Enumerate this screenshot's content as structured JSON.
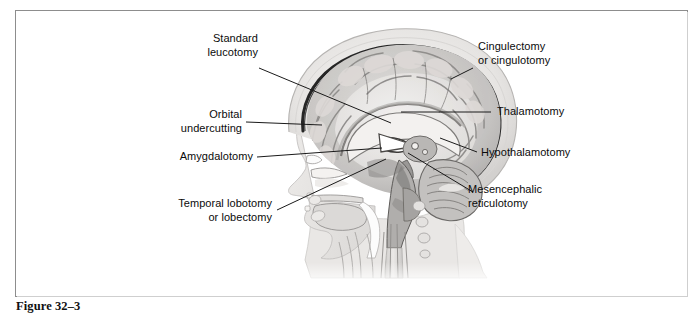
{
  "figure": {
    "caption": "Figure 32–3",
    "frame_color": "#8d8d8d",
    "background": "#ffffff",
    "text_color": "#0b0b0b",
    "leader_line_color": "#1a1a1a"
  },
  "illustration": {
    "name": "mid-sagittal-head-section",
    "description": "Grayscale halftone mid-sagittal anatomical section of a human head and neck showing cerebrum, corpus callosum, thalamus, cerebellum, brainstem, nasal cavity, tongue, pharynx and cervical vertebrae",
    "tones": {
      "skin": "#e8e6e4",
      "skull": "#f2f0ee",
      "dura": "#2a2a2a",
      "cortex": "#c9c7c5",
      "white_matter": "#efedeb",
      "deep_gray": "#a6a4a2",
      "cerebellum": "#bcbab8",
      "airway": "#fbfbfb",
      "cord": "#d8d6d4"
    }
  },
  "labels": [
    {
      "id": "standard-leucotomy",
      "text": "Standard\nleucotomy",
      "align": "right",
      "x": 196,
      "y": 32,
      "w": 62,
      "leader": {
        "x1": 259,
        "y1": 68,
        "x2": 391,
        "y2": 123
      }
    },
    {
      "id": "orbital-undercutting",
      "text": "Orbital\nundercutting",
      "align": "right",
      "x": 166,
      "y": 108,
      "w": 76,
      "leader": {
        "x1": 246,
        "y1": 122,
        "x2": 322,
        "y2": 125
      }
    },
    {
      "id": "amygdalotomy",
      "text": "Amygdalotomy",
      "align": "right",
      "x": 167,
      "y": 150,
      "w": 86,
      "leader": {
        "x1": 257,
        "y1": 157,
        "x2": 382,
        "y2": 148
      }
    },
    {
      "id": "temporal-lobotomy",
      "text": "Temporal lobotomy\nor lobectomy",
      "align": "right",
      "x": 160,
      "y": 197,
      "w": 112,
      "leader": {
        "x1": 277,
        "y1": 210,
        "x2": 386,
        "y2": 159
      }
    },
    {
      "id": "cingulectomy",
      "text": "Cingulectomy\nor cingulotomy",
      "align": "left",
      "x": 478,
      "y": 40,
      "w": 92,
      "leader": {
        "x1": 451,
        "y1": 79,
        "x2": 473,
        "y2": 68
      }
    },
    {
      "id": "thalamotomy",
      "text": "Thalamotomy",
      "align": "left",
      "x": 497,
      "y": 105,
      "w": 82,
      "leader": {
        "x1": 401,
        "y1": 112,
        "x2": 491,
        "y2": 112
      }
    },
    {
      "id": "hypothalamotomy",
      "text": "Hypothalamotomy",
      "align": "left",
      "x": 481,
      "y": 146,
      "w": 106,
      "leader": {
        "x1": 440,
        "y1": 138,
        "x2": 477,
        "y2": 152
      }
    },
    {
      "id": "mesencephalic-reticulotomy",
      "text": "Mesencephalic\nreticulotomy",
      "align": "left",
      "x": 468,
      "y": 183,
      "w": 92,
      "leader": {
        "x1": 408,
        "y1": 153,
        "x2": 473,
        "y2": 192
      }
    }
  ]
}
